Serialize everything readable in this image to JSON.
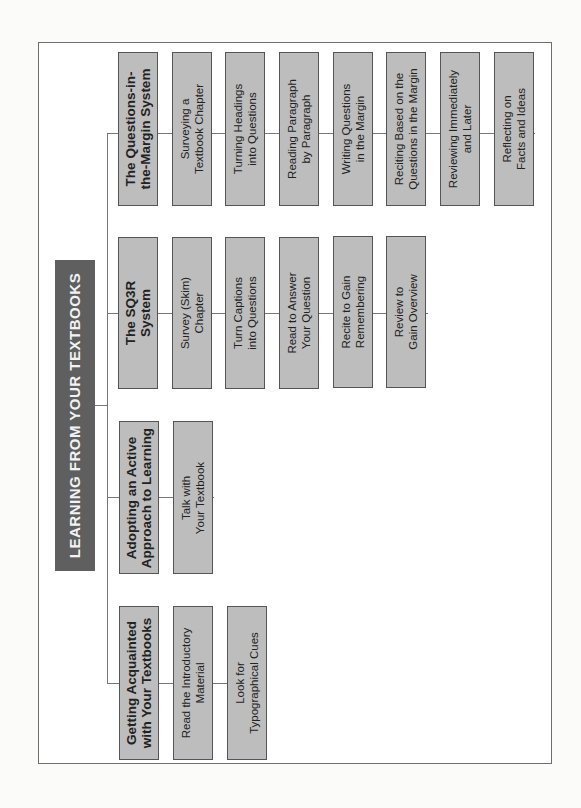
{
  "diagram": {
    "title": "LEARNING FROM YOUR TEXTBOOKS",
    "colors": {
      "title_fill": "#5f5f5f",
      "box_fill": "#bdbdbd",
      "box_border": "#555555",
      "connector": "#777777"
    },
    "branches": [
      {
        "heading": "The Questions-in-\nthe-Margin System",
        "steps": [
          "Surveying a\nTextbook Chapter",
          "Turning Headings\ninto Questions",
          "Reading Paragraph\nby Paragraph",
          "Writing Questions\nin the Margin",
          "Reciting Based on the\nQuestions in the Margin",
          "Reviewing Immediately\nand Later",
          "Reflecting on\nFacts and Ideas"
        ]
      },
      {
        "heading": "The SQ3R\nSystem",
        "steps": [
          "Survey (Skim)\nChapter",
          "Turn Captions\ninto Questions",
          "Read to Answer\nYour Question",
          "Recite to Gain\nRemembering",
          "Review to\nGain Overview"
        ]
      },
      {
        "heading": "Adopting an Active\nApproach to Learning",
        "steps": [
          "Talk with\nYour Textbook"
        ]
      },
      {
        "heading": "Getting Acquainted\nwith Your Textbooks",
        "steps": [
          "Read the Introductory\nMaterial",
          "Look for\nTypographical Cues"
        ]
      }
    ]
  }
}
